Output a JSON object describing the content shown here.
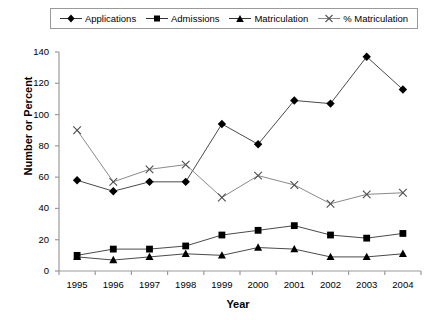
{
  "chart_data": {
    "type": "line",
    "title": "",
    "xlabel": "Year",
    "ylabel": "Number or Percent",
    "categories": [
      "1995",
      "1996",
      "1997",
      "1998",
      "1999",
      "2000",
      "2001",
      "2002",
      "2003",
      "2004"
    ],
    "x": [
      1995,
      1996,
      1997,
      1998,
      1999,
      2000,
      2001,
      2002,
      2003,
      2004
    ],
    "ylim": [
      0,
      140
    ],
    "yticks": [
      0,
      20,
      40,
      60,
      80,
      100,
      120,
      140
    ],
    "ytick_labels": [
      "0",
      "20",
      "40",
      "60",
      "80",
      "100",
      "120",
      "140"
    ],
    "xlim": [
      1994.5,
      2004.5
    ],
    "grid": false,
    "legend_position": "top",
    "series": [
      {
        "name": "Applications",
        "marker": "diamond",
        "color": "#000000",
        "values": [
          58,
          51,
          57,
          57,
          94,
          81,
          109,
          107,
          137,
          116
        ]
      },
      {
        "name": "Admissions",
        "marker": "square",
        "color": "#000000",
        "values": [
          10,
          14,
          14,
          16,
          23,
          26,
          29,
          23,
          21,
          24
        ]
      },
      {
        "name": "Matriculation",
        "marker": "triangle",
        "color": "#000000",
        "values": [
          9,
          7,
          9,
          11,
          10,
          15,
          14,
          9,
          9,
          11
        ]
      },
      {
        "name": "% Matriculation",
        "marker": "x",
        "color": "#8a8a8a",
        "values": [
          90,
          57,
          65,
          68,
          47,
          61,
          55,
          43,
          49,
          50
        ]
      }
    ]
  },
  "legend": {
    "entries": [
      {
        "label": "Applications",
        "marker": "diamond"
      },
      {
        "label": "Admissions",
        "marker": "square"
      },
      {
        "label": "Matriculation",
        "marker": "triangle"
      },
      {
        "label": "% Matriculation",
        "marker": "x"
      }
    ]
  }
}
